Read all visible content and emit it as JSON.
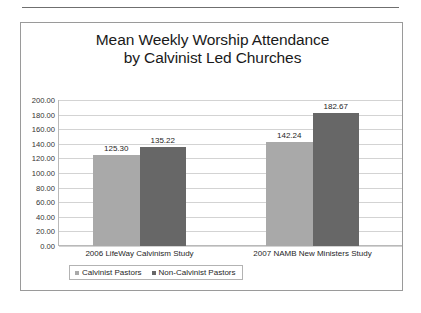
{
  "chart_data": {
    "type": "bar",
    "title_line1": "Mean Weekly Worship Attendance",
    "title_line2": "by Calvinist Led Churches",
    "categories": [
      "2006 LifeWay Calvinism Study",
      "2007 NAMB New Ministers Study"
    ],
    "series": [
      {
        "name": "Calvinist Pastors",
        "values": [
          125.3,
          135.22
        ],
        "color": "#a9a9a9"
      },
      {
        "name": "Non-Calvinist Pastors",
        "values": [
          142.24,
          182.67
        ],
        "color": "#676767"
      }
    ],
    "series_note": "series 0 = light gray = Calvinist Pastors; series 1 = dark gray = Non-Calvinist Pastors",
    "bars": [
      {
        "group": 0,
        "series": 0,
        "label": "125.30",
        "value": 125.3
      },
      {
        "group": 0,
        "series": 1,
        "label": "135.22",
        "value": 135.22
      },
      {
        "group": 1,
        "series": 0,
        "label": "142.24",
        "value": 142.24
      },
      {
        "group": 1,
        "series": 1,
        "label": "182.67",
        "value": 182.67
      }
    ],
    "xlabel": "",
    "ylabel": "",
    "ylim": [
      0,
      200
    ],
    "ytick_step": 20,
    "ytick_labels": [
      "200.00",
      "180.00",
      "160.00",
      "140.00",
      "120.00",
      "100.00",
      "80.00",
      "60.00",
      "40.00",
      "20.00",
      "0.00"
    ],
    "ytick_values": [
      200,
      180,
      160,
      140,
      120,
      100,
      80,
      60,
      40,
      20,
      0
    ],
    "grid": true,
    "legend_position": "bottom-left",
    "data_labels": true
  },
  "legend": {
    "entries": [
      {
        "label": "Calvinist Pastors"
      },
      {
        "label": "Non-Calvinist Pastors"
      }
    ]
  }
}
